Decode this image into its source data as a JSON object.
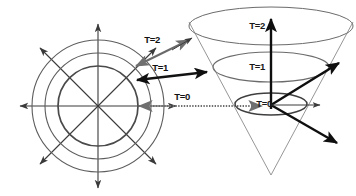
{
  "figure": {
    "background_color": "#ffffff",
    "stroke_color": "#3a3a3a",
    "bold_stroke_color": "#111111",
    "light_stroke_color": "#7d7d7d"
  },
  "left_panel": {
    "name": "concentric-wavefronts",
    "center": {
      "x": 98,
      "y": 106
    },
    "circles": [
      {
        "label": "T=0",
        "radius": 40
      },
      {
        "label": "T=1",
        "radius": 53
      },
      {
        "label": "T=2",
        "radius": 66
      }
    ],
    "radial_arrow_count": 8,
    "radial_arrow_angles_deg": [
      0,
      45,
      90,
      135,
      180,
      225,
      270,
      315
    ],
    "radial_arrow_length": 88
  },
  "connector_arrows": [
    {
      "label": "T=0",
      "direction": "horizontal",
      "style": "dotted-shaft-double-head"
    },
    {
      "label": "T=1",
      "direction": "slight-diagonal-up",
      "style": "solid-double-head"
    },
    {
      "label": "T=2",
      "direction": "diagonal-up",
      "style": "solid-double-head"
    }
  ],
  "right_panel": {
    "name": "light-cone-3d",
    "apex": {
      "x": 271,
      "y": 175
    },
    "axis_label_vertical": "time",
    "slices": [
      {
        "label": "T=0",
        "cy": 104,
        "rx": 36,
        "ry": 11
      },
      {
        "label": "T=1",
        "cy": 67,
        "rx": 58,
        "ry": 15
      },
      {
        "label": "T=2",
        "cy": 26,
        "rx": 82,
        "ry": 19
      }
    ],
    "axes": [
      {
        "name": "time-axis",
        "kind": "vertical-bold-arrow"
      },
      {
        "name": "x-axis",
        "kind": "diagonal-down-right-bold-arrow"
      },
      {
        "name": "y-axis",
        "kind": "diagonal-up-right-bold-arrow"
      },
      {
        "name": "y-axis-thin",
        "kind": "horizontal-thin-arrow"
      }
    ]
  },
  "labels": {
    "t0": "T=0",
    "t1": "T=1",
    "t2": "T=2",
    "cone_t0": "T=0",
    "cone_t1": "T=1",
    "cone_t2": "T=2"
  }
}
